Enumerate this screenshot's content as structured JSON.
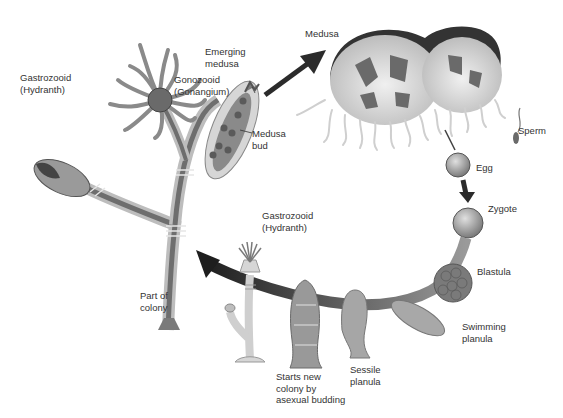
{
  "diagram": {
    "labels": {
      "gastrozooid_top": "Gastrozooid\n(Hydranth)",
      "gonozooid": "Gonozooid\n(Gonangium)",
      "emerging_medusa": "Emerging\nmedusa",
      "medusa_bud": "Medusa\nbud",
      "medusa": "Medusa",
      "sperm": "Sperm",
      "egg": "Egg",
      "zygote": "Zygote",
      "blastula": "Blastula",
      "swimming_planula": "Swimming\nplanula",
      "sessile_planula": "Sessile\nplanula",
      "starts_new_colony": "Starts new\ncolony by\nasexual budding",
      "gastrozooid_bottom": "Gastrozooid\n(Hydranth)",
      "part_of_colony": "Part of\ncolony"
    },
    "colors": {
      "arrow": "#2b2b2b",
      "tissue_dark": "#6e6e6e",
      "tissue_mid": "#9a9a9a",
      "tissue_light": "#cfcfcf",
      "bell": "#3a3a3a"
    }
  }
}
